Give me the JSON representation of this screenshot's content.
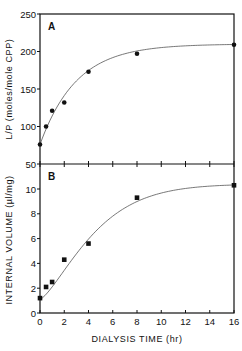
{
  "chart_data": [
    {
      "type": "scatter",
      "panel": "A",
      "title": "",
      "xlabel": "DIALYSIS TIME (hr)",
      "ylabel": "L/P (moles/mole CPP)",
      "xlim": [
        0,
        16
      ],
      "ylim": [
        50,
        250
      ],
      "yticks": [
        50,
        100,
        150,
        200,
        250
      ],
      "xticks": [
        0,
        2,
        4,
        6,
        8,
        10,
        12,
        14,
        16
      ],
      "grid": false,
      "marker": "circle",
      "fitted_curve": true,
      "x": [
        0,
        0.5,
        1,
        2,
        4,
        8,
        16
      ],
      "y": [
        76,
        100,
        121,
        132,
        173,
        197,
        209
      ]
    },
    {
      "type": "scatter",
      "panel": "B",
      "title": "",
      "xlabel": "DIALYSIS TIME (hr)",
      "ylabel": "INTERNAL VOLUME (µl/mg)",
      "xlim": [
        0,
        16
      ],
      "ylim": [
        0,
        12
      ],
      "yticks": [
        0,
        2,
        4,
        6,
        8,
        10
      ],
      "xticks": [
        0,
        2,
        4,
        6,
        8,
        10,
        12,
        14,
        16
      ],
      "grid": false,
      "marker": "square",
      "fitted_curve": true,
      "x": [
        0,
        0.5,
        1,
        2,
        4,
        8,
        16
      ],
      "y": [
        1.2,
        2.1,
        2.5,
        4.3,
        5.6,
        9.3,
        10.3
      ]
    }
  ],
  "panels": {
    "a": {
      "label": "A",
      "ylabel": "L/P (moles/mole CPP)"
    },
    "b": {
      "label": "B",
      "ylabel": "INTERNAL VOLUME (µl/mg)"
    }
  },
  "xaxis": {
    "label": "DIALYSIS TIME (hr)"
  },
  "colors": {
    "ink": "#111111",
    "curve": "#555555",
    "background": "#ffffff"
  }
}
